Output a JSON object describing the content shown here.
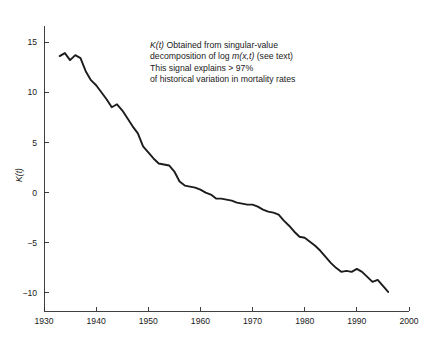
{
  "figure": {
    "name": "mortality-index-kt-timeseries",
    "background": "#ffffff",
    "line_color": "#1c1c1c",
    "axis_color": "#2b2b2b"
  },
  "annotation": {
    "lines": [
      "K(t) Obtained from singular-value",
      "decomposition of log m(x,t) (see text)",
      "This signal explains > 97%",
      "of historical variation in mortality rates"
    ],
    "line1_prefix_italic": "K(t)",
    "line1_rest": " Obtained from singular-value",
    "line2_pre": "decomposition of log ",
    "line2_italic": "m(x,t)",
    "line2_post": " (see text)",
    "line3": "This signal explains > 97%",
    "line4": "of historical variation in mortality rates"
  },
  "chart_data": {
    "type": "line",
    "title": "",
    "xlabel": "",
    "ylabel": "K(t)",
    "xlim": [
      1930,
      2000
    ],
    "ylim": [
      -11.8,
      16.6
    ],
    "grid": false,
    "legend": null,
    "xticks": [
      1930,
      1940,
      1950,
      1960,
      1970,
      1980,
      1990,
      2000
    ],
    "xtick_labels": [
      "1930",
      "1940",
      "1950",
      "1960",
      "1970",
      "1980",
      "1990",
      "2000"
    ],
    "yticks": [
      15,
      10,
      5,
      0,
      -5,
      -10
    ],
    "ytick_labels": [
      "15",
      "10",
      "5",
      "0",
      "-5",
      "-10"
    ],
    "series": [
      {
        "name": "K(t)",
        "color": "#1c1c1c",
        "x": [
          1933,
          1934,
          1935,
          1936,
          1937,
          1938,
          1939,
          1940,
          1941,
          1942,
          1943,
          1944,
          1945,
          1946,
          1947,
          1948,
          1949,
          1950,
          1951,
          1952,
          1953,
          1954,
          1955,
          1956,
          1957,
          1958,
          1959,
          1960,
          1961,
          1962,
          1963,
          1964,
          1965,
          1966,
          1967,
          1968,
          1969,
          1970,
          1971,
          1972,
          1973,
          1974,
          1975,
          1976,
          1977,
          1978,
          1979,
          1980,
          1981,
          1982,
          1983,
          1984,
          1985,
          1986,
          1987,
          1988,
          1989,
          1990,
          1991,
          1992,
          1993,
          1994,
          1995,
          1996
        ],
        "y": [
          13.6,
          13.9,
          13.2,
          13.7,
          13.4,
          12.1,
          11.2,
          10.7,
          10.0,
          9.3,
          8.5,
          8.8,
          8.2,
          7.4,
          6.6,
          5.9,
          4.6,
          4.0,
          3.4,
          2.9,
          2.8,
          2.7,
          2.1,
          1.1,
          0.7,
          0.6,
          0.5,
          0.3,
          0.0,
          -0.2,
          -0.6,
          -0.6,
          -0.7,
          -0.8,
          -1.0,
          -1.1,
          -1.2,
          -1.2,
          -1.4,
          -1.7,
          -1.9,
          -2.0,
          -2.2,
          -2.8,
          -3.3,
          -3.9,
          -4.4,
          -4.5,
          -4.9,
          -5.3,
          -5.8,
          -6.4,
          -7.0,
          -7.5,
          -7.9,
          -7.8,
          -7.9,
          -7.6,
          -7.9,
          -8.4,
          -8.9,
          -8.7,
          -9.3,
          -9.9
        ]
      }
    ]
  }
}
